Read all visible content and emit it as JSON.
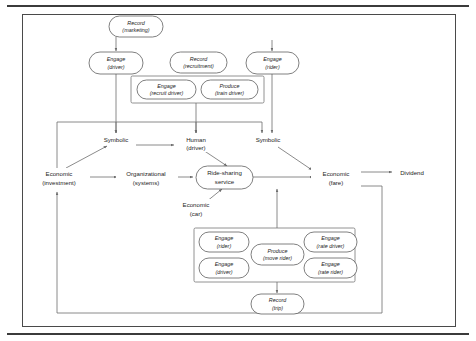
{
  "figure": {
    "frame": {
      "x": 22,
      "y": 14,
      "width": 434,
      "height": 313
    },
    "colors": {
      "rule": "#3b3b3b",
      "frame_border": "#4a4a4a",
      "node_stroke": "#555555",
      "group_stroke": "#6e6e6e",
      "connector": "#6d6d6d",
      "text": "#1d1d1d",
      "background": "#ffffff"
    }
  },
  "nodes": {
    "record_marketing": {
      "line1": "Record",
      "line2": "(marketing)",
      "x": 136,
      "y": 26,
      "w": 54,
      "h": 20,
      "style": "rounded-italic"
    },
    "engage_driver_top": {
      "line1": "Engage",
      "line2": "(driver)",
      "x": 116,
      "y": 63,
      "w": 54,
      "h": 21,
      "style": "rounded-italic"
    },
    "record_recruitment": {
      "line1": "Record",
      "line2": "(recruitment)",
      "x": 198,
      "y": 62,
      "w": 56,
      "h": 20,
      "style": "rounded-italic"
    },
    "engage_rider_top": {
      "line1": "Engage",
      "line2": "(rider)",
      "x": 272,
      "y": 63,
      "w": 52,
      "h": 21,
      "style": "rounded-italic"
    },
    "engage_recruit_driver": {
      "line1": "Engage",
      "line2": "(recruit driver)",
      "x": 166,
      "y": 89,
      "w": 58,
      "h": 20,
      "style": "rounded-italic"
    },
    "produce_train_driver": {
      "line1": "Produce",
      "line2": "(train driver)",
      "x": 229,
      "y": 89,
      "w": 56,
      "h": 20,
      "style": "rounded-italic"
    },
    "symbolic_left": {
      "line1": "Symbolic",
      "line2": "",
      "x": 116,
      "y": 139,
      "style": "plain"
    },
    "human_driver": {
      "line1": "Human",
      "line2": "(driver)",
      "x": 196,
      "y": 139,
      "style": "plain"
    },
    "symbolic_right": {
      "line1": "Symbolic",
      "line2": "",
      "x": 268,
      "y": 139,
      "style": "plain"
    },
    "economic_investment": {
      "line1": "Economic",
      "line2": "(investment)",
      "x": 60,
      "y": 176,
      "style": "plain"
    },
    "organizational_systems": {
      "line1": "Organizational",
      "line2": "(systems)",
      "x": 146,
      "y": 176,
      "style": "plain"
    },
    "ride_sharing_service": {
      "line1": "Ride-sharing",
      "line2": "service",
      "x": 224,
      "y": 176,
      "w": 56,
      "h": 22,
      "style": "rounded-plain"
    },
    "economic_fare": {
      "line1": "Economic",
      "line2": "(fare)",
      "x": 335,
      "y": 176,
      "style": "plain"
    },
    "dividend": {
      "line1": "Dividend",
      "line2": "",
      "x": 412,
      "y": 172,
      "style": "plain"
    },
    "economic_car": {
      "line1": "Economic",
      "line2": "(car)",
      "x": 196,
      "y": 207,
      "style": "plain"
    },
    "engage_rider_lower": {
      "line1": "Engage",
      "line2": "(rider)",
      "x": 222,
      "y": 241,
      "w": 50,
      "h": 20,
      "style": "rounded-italic"
    },
    "engage_driver_lower": {
      "line1": "Engage",
      "line2": "(driver)",
      "x": 222,
      "y": 268,
      "w": 50,
      "h": 20,
      "style": "rounded-italic"
    },
    "produce_move_rider": {
      "line1": "Produce",
      "line2": "(move rider)",
      "x": 277,
      "y": 254,
      "w": 52,
      "h": 21,
      "style": "rounded-italic"
    },
    "engage_rate_driver": {
      "line1": "Engage",
      "line2": "(rate driver)",
      "x": 330,
      "y": 241,
      "w": 52,
      "h": 20,
      "style": "rounded-italic"
    },
    "engage_rate_rider": {
      "line1": "Engage",
      "line2": "(rate rider)",
      "x": 330,
      "y": 268,
      "w": 52,
      "h": 20,
      "style": "rounded-italic"
    },
    "record_trip": {
      "line1": "Record",
      "line2": "(trip)",
      "x": 277,
      "y": 303,
      "w": 52,
      "h": 20,
      "style": "rounded-italic"
    }
  },
  "groups": {
    "driver_onboarding_box": {
      "x": 131,
      "y": 76,
      "width": 133,
      "height": 27
    },
    "trip_activities_box": {
      "x": 194,
      "y": 228,
      "width": 161,
      "height": 54
    }
  },
  "edges": [
    {
      "from": "record_marketing",
      "to": "engage_driver_top",
      "type": "vertical-arrow"
    },
    {
      "from": "engage_rider_source",
      "to": "engage_rider_top",
      "type": "vertical-arrow"
    },
    {
      "from": "engage_driver_top",
      "to": "symbolic_left",
      "type": "vertical-arrow"
    },
    {
      "from": "driver_onboarding_box",
      "to": "human_driver",
      "type": "vertical-arrow"
    },
    {
      "from": "engage_rider_top",
      "to": "symbolic_right",
      "type": "vertical-arrow"
    },
    {
      "from": "feedback_loop_top",
      "to": "symbolic_left",
      "type": "orthogonal"
    },
    {
      "from": "feedback_loop_top",
      "to": "human_driver",
      "type": "orthogonal"
    },
    {
      "from": "feedback_loop_top",
      "to": "symbolic_right",
      "type": "orthogonal"
    },
    {
      "from": "economic_investment",
      "to": "symbolic_left",
      "type": "diagonal-arrow"
    },
    {
      "from": "symbolic_left",
      "to": "human_driver",
      "type": "horizontal-arrow"
    },
    {
      "from": "economic_investment",
      "to": "organizational_systems",
      "type": "horizontal-arrow"
    },
    {
      "from": "organizational_systems",
      "to": "ride_sharing_service",
      "type": "horizontal-arrow"
    },
    {
      "from": "human_driver",
      "to": "ride_sharing_service",
      "type": "diagonal-arrow"
    },
    {
      "from": "symbolic_right",
      "to": "economic_fare",
      "type": "diagonal-arrow"
    },
    {
      "from": "ride_sharing_service",
      "to": "economic_fare",
      "type": "horizontal-arrow"
    },
    {
      "from": "economic_fare",
      "to": "dividend",
      "type": "horizontal-arrow"
    },
    {
      "from": "economic_car",
      "to": "ride_sharing_service",
      "type": "diagonal-arrow"
    },
    {
      "from": "trip_activities_box",
      "to": "ride_sharing_service",
      "type": "vertical-arrow"
    },
    {
      "from": "trip_activities_box",
      "to": "record_trip",
      "type": "vertical-arrow"
    },
    {
      "from": "economic_fare",
      "to": "economic_investment",
      "type": "feedback-loop"
    }
  ]
}
